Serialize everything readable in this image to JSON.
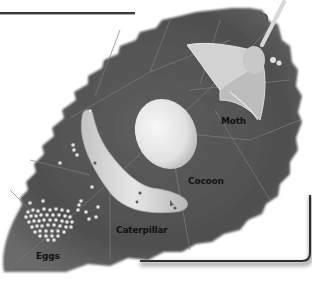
{
  "figure": {
    "colors": {
      "background": "#ffffff",
      "leaf": "#555555",
      "leaf_dark": "#3f3f3f",
      "vein": "#7a7a7a",
      "frame": "#3a3a3a",
      "cocoon": "#e8e8e8",
      "caterpillar": "#d6d6d6",
      "eggs": "#e4e4e4",
      "moth": "#d0d0d0",
      "label_text": "#111111"
    },
    "labels": {
      "moth": "Moth",
      "cocoon": "Cocoon",
      "caterpillar": "Caterpillar",
      "eggs": "Eggs"
    }
  }
}
